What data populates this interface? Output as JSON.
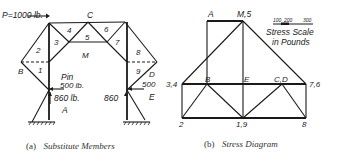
{
  "figure_a": {
    "caption_prefix": "(a)",
    "caption": "Substitute Members",
    "load_label": "P=1000 lb.",
    "node_labels": {
      "C": "C",
      "B": "B",
      "D": "D",
      "M": "M",
      "A": "A",
      "E": "E"
    },
    "member_numbers": [
      "1",
      "2",
      "3",
      "4",
      "5",
      "6",
      "7",
      "8",
      "9"
    ],
    "pin_label": "Pin",
    "left_horizontal_reaction": "500 lb.",
    "left_vertical_reaction": "860 lb.",
    "right_horizontal_reaction": "500",
    "right_vertical_reaction": "860"
  },
  "figure_b": {
    "caption_prefix": "(b)",
    "caption": "Stress Diagram",
    "scale_ticks": [
      "100",
      "200",
      "300"
    ],
    "scale_title_line1": "Stress Scale",
    "scale_title_line2": "in Pounds",
    "points": {
      "A": "A",
      "M5": "M,5",
      "p34": "3,4",
      "B": "B",
      "E": "E",
      "CD": "C,D",
      "p76": "7,6",
      "p2": "2",
      "p19": "1,9",
      "p8": "8"
    }
  }
}
